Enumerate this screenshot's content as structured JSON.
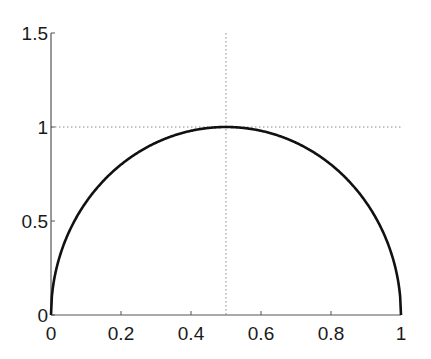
{
  "chart_data": {
    "type": "line",
    "title": "",
    "xlabel": "",
    "ylabel": "",
    "xlim": [
      0,
      1
    ],
    "ylim": [
      0,
      1.5
    ],
    "grid": false,
    "legend": null,
    "x_ticks": [
      0,
      0.2,
      0.4,
      0.6,
      0.8,
      1
    ],
    "x_tick_labels": [
      "0",
      "0.2",
      "0.4",
      "0.6",
      "0.8",
      "1"
    ],
    "y_ticks": [
      0,
      0.5,
      1,
      1.5
    ],
    "y_tick_labels": [
      "0",
      "0.5",
      "1",
      "1.5"
    ],
    "series": [
      {
        "name": "curve",
        "style": "solid",
        "color": "#111111",
        "x": [
          0,
          0.01,
          0.025,
          0.05,
          0.1,
          0.15,
          0.2,
          0.25,
          0.3,
          0.35,
          0.4,
          0.45,
          0.5,
          0.55,
          0.6,
          0.65,
          0.7,
          0.75,
          0.8,
          0.85,
          0.9,
          0.95,
          0.975,
          0.99,
          1
        ],
        "y": [
          0,
          0.199,
          0.312,
          0.436,
          0.6,
          0.714,
          0.8,
          0.866,
          0.917,
          0.954,
          0.98,
          0.995,
          1,
          0.995,
          0.98,
          0.954,
          0.917,
          0.866,
          0.8,
          0.714,
          0.6,
          0.436,
          0.312,
          0.199,
          0
        ]
      }
    ],
    "annotations": [
      {
        "type": "hline",
        "y": 1,
        "style": "dotted",
        "color": "#888888"
      },
      {
        "type": "vline",
        "x": 0.5,
        "style": "dotted",
        "color": "#888888"
      }
    ]
  }
}
